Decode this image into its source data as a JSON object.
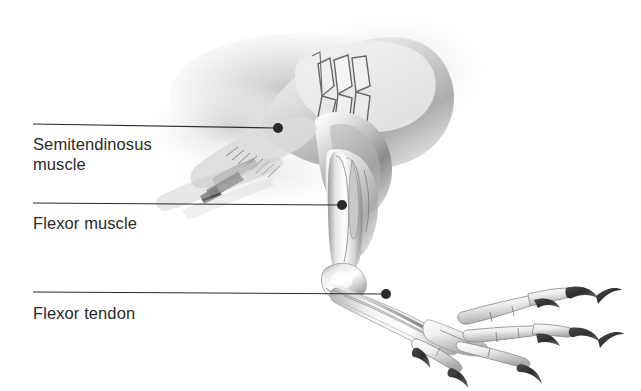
{
  "figure": {
    "type": "anatomical-illustration",
    "background_color": "#ffffff",
    "ink_color": "#2a2a2a",
    "bone_light": "#fdfdfd",
    "bone_mid": "#d8d8d8",
    "bone_shadow": "#8e8e8e",
    "tissue_tint": "#c9c9c9"
  },
  "annotations": [
    {
      "id": "semitendinosus-muscle",
      "label": "Semitendinosus\nmuscle",
      "line_start_x": 33,
      "line_start_y": 124,
      "line_end_x": 276,
      "line_end_y": 128,
      "dot_x": 278,
      "dot_y": 128,
      "dot_r": 5
    },
    {
      "id": "flexor-muscle",
      "label": "Flexor muscle",
      "line_start_x": 33,
      "line_start_y": 203,
      "line_end_x": 340,
      "line_end_y": 205,
      "dot_x": 342,
      "dot_y": 205,
      "dot_r": 5
    },
    {
      "id": "flexor-tendon",
      "label": "Flexor tendon",
      "line_start_x": 33,
      "line_start_y": 292,
      "line_end_x": 384,
      "line_end_y": 294,
      "dot_x": 386,
      "dot_y": 294,
      "dot_r": 5
    }
  ]
}
